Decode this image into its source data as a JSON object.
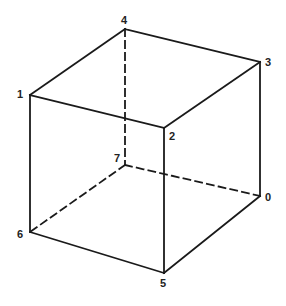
{
  "diagram": {
    "title": "",
    "type": "wireframe-cube",
    "stroke_color": "#1a1a1a",
    "vertices": [
      {
        "id": "0",
        "label": "0",
        "x": 260,
        "y": 196,
        "lx": 265,
        "ly": 192
      },
      {
        "id": "1",
        "label": "1",
        "x": 30,
        "y": 95,
        "lx": 17,
        "ly": 89
      },
      {
        "id": "2",
        "label": "2",
        "x": 164,
        "y": 128,
        "lx": 169,
        "ly": 131
      },
      {
        "id": "3",
        "label": "3",
        "x": 260,
        "y": 62,
        "lx": 265,
        "ly": 57
      },
      {
        "id": "4",
        "label": "4",
        "x": 125,
        "y": 29,
        "lx": 121,
        "ly": 15
      },
      {
        "id": "5",
        "label": "5",
        "x": 164,
        "y": 273,
        "lx": 160,
        "ly": 278
      },
      {
        "id": "6",
        "label": "6",
        "x": 30,
        "y": 232,
        "lx": 17,
        "ly": 229
      },
      {
        "id": "7",
        "label": "7",
        "x": 125,
        "y": 165,
        "lx": 114,
        "ly": 153
      }
    ],
    "edges": [
      {
        "from": "1",
        "to": "4",
        "style": "solid"
      },
      {
        "from": "4",
        "to": "3",
        "style": "solid"
      },
      {
        "from": "3",
        "to": "2",
        "style": "solid"
      },
      {
        "from": "2",
        "to": "1",
        "style": "solid"
      },
      {
        "from": "1",
        "to": "6",
        "style": "solid"
      },
      {
        "from": "2",
        "to": "5",
        "style": "solid"
      },
      {
        "from": "3",
        "to": "0",
        "style": "solid"
      },
      {
        "from": "6",
        "to": "5",
        "style": "solid"
      },
      {
        "from": "5",
        "to": "0",
        "style": "solid"
      },
      {
        "from": "4",
        "to": "7",
        "style": "dashed"
      },
      {
        "from": "7",
        "to": "6",
        "style": "dashed"
      },
      {
        "from": "7",
        "to": "0",
        "style": "dashed"
      }
    ]
  }
}
